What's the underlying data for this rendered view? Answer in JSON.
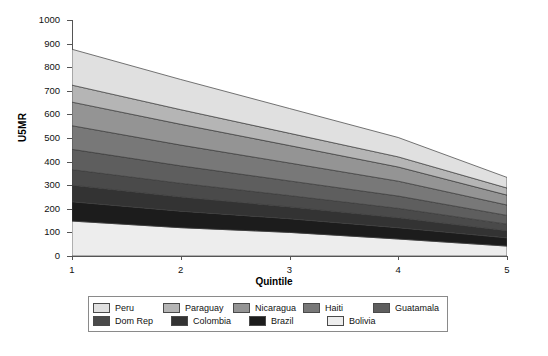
{
  "chart_data": {
    "type": "area",
    "title": "",
    "subtitle": "",
    "xlabel": "Quintile",
    "ylabel": "U5MR",
    "x": [
      1,
      2,
      3,
      4,
      5
    ],
    "xtick_labels": [
      "1",
      "2",
      "3",
      "4",
      "5"
    ],
    "ytick_labels": [
      "0",
      "100",
      "200",
      "300",
      "400",
      "500",
      "600",
      "700",
      "800",
      "900",
      "1000"
    ],
    "ytick_values": [
      0,
      100,
      200,
      300,
      400,
      500,
      600,
      700,
      800,
      900,
      1000
    ],
    "ylim": [
      0,
      1000
    ],
    "xlim": [
      1,
      5
    ],
    "grid": false,
    "stacked": true,
    "stack_order_bottom_to_top": [
      "Bolivia",
      "Brazil",
      "Colombia",
      "Dom Rep",
      "Guatamala",
      "Haiti",
      "Nicaragua",
      "Paraguay",
      "Peru"
    ],
    "legend_position": "bottom",
    "series": [
      {
        "name": "Bolivia",
        "color": "#ededed",
        "values": [
          148,
          120,
          100,
          72,
          42
        ]
      },
      {
        "name": "Brazil",
        "color": "#1c1c1c",
        "values": [
          82,
          70,
          58,
          48,
          35
        ]
      },
      {
        "name": "Colombia",
        "color": "#333333",
        "values": [
          70,
          60,
          50,
          42,
          30
        ]
      },
      {
        "name": "Dom Rep",
        "color": "#4a4a4a",
        "values": [
          66,
          58,
          48,
          40,
          28
        ]
      },
      {
        "name": "Guatamala",
        "color": "#5e5e5e",
        "values": [
          86,
          74,
          62,
          52,
          37
        ]
      },
      {
        "name": "Haiti",
        "color": "#787878",
        "values": [
          100,
          88,
          76,
          63,
          44
        ]
      },
      {
        "name": "Nicaragua",
        "color": "#949494",
        "values": [
          100,
          88,
          74,
          60,
          42
        ]
      },
      {
        "name": "Paraguay",
        "color": "#b5b5b5",
        "values": [
          72,
          62,
          52,
          43,
          30
        ]
      },
      {
        "name": "Peru",
        "color": "#e0e0e0",
        "values": [
          152,
          128,
          105,
          82,
          45
        ]
      }
    ]
  },
  "legend": {
    "rows": [
      [
        {
          "label": "Peru",
          "color": "#e0e0e0"
        },
        {
          "label": "Paraguay",
          "color": "#b5b5b5"
        },
        {
          "label": "Nicaragua",
          "color": "#949494"
        },
        {
          "label": "Haiti",
          "color": "#787878"
        },
        {
          "label": "Guatamala",
          "color": "#5e5e5e"
        }
      ],
      [
        {
          "label": "Dom Rep",
          "color": "#4a4a4a"
        },
        {
          "label": "Colombia",
          "color": "#333333"
        },
        {
          "label": "Brazil",
          "color": "#1c1c1c"
        },
        {
          "label": "Bolivia",
          "color": "#ededed"
        }
      ]
    ]
  }
}
